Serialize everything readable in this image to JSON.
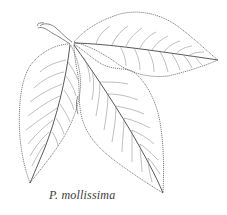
{
  "figure": {
    "caption": "P. mollissima",
    "colors": {
      "background": "#ffffff",
      "line": "#555555",
      "caption": "#3a3a3a"
    }
  }
}
